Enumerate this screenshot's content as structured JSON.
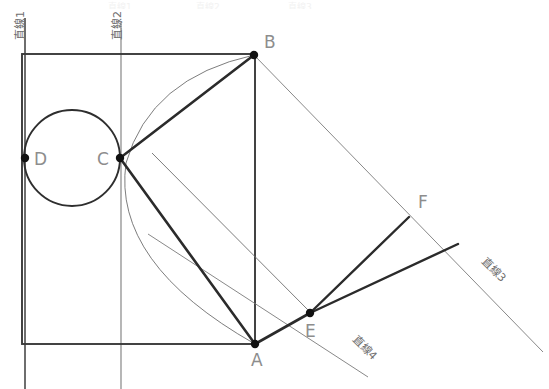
{
  "figure": {
    "background_color": "#ffffff",
    "stroke_dark": "#3a3a3a",
    "stroke_thin": "#6e6e6e",
    "label_color": "#8d8d8d"
  },
  "points": [
    {
      "id": "A",
      "label": "A",
      "x": 255,
      "y": 344,
      "label_x": 251,
      "label_y": 366
    },
    {
      "id": "B",
      "label": "B",
      "x": 254,
      "y": 55,
      "label_x": 264,
      "label_y": 48
    },
    {
      "id": "C",
      "label": "C",
      "x": 120,
      "y": 158,
      "label_x": 97,
      "label_y": 165
    },
    {
      "id": "D",
      "label": "D",
      "x": 25,
      "y": 158,
      "label_x": 34,
      "label_y": 165
    },
    {
      "id": "E",
      "label": "E",
      "x": 310,
      "y": 313,
      "label_x": 305,
      "label_y": 337
    },
    {
      "id": "F",
      "label": "F",
      "x": 411,
      "y": 215,
      "label_x": 418,
      "label_y": 208
    }
  ],
  "lines": [
    {
      "id": "line1",
      "label": "直線1",
      "label_x": 24,
      "label_y": 40,
      "rotation": -90
    },
    {
      "id": "line2",
      "label": "直線2",
      "label_x": 121,
      "label_y": 40,
      "rotation": -90
    },
    {
      "id": "line3",
      "label": "直線3",
      "label_x": 481,
      "label_y": 262,
      "rotation": 45
    },
    {
      "id": "line4",
      "label": "直線4",
      "label_x": 352,
      "label_y": 340,
      "rotation": 45
    }
  ],
  "circle": {
    "center_x": 72,
    "center_y": 158,
    "radius": 48
  },
  "rectangle": {
    "x": 22,
    "y": 54,
    "width": 233,
    "height": 290
  },
  "ghost_header": [
    {
      "text": "直線1",
      "x": 108
    },
    {
      "text": "直線2",
      "x": 196
    },
    {
      "text": "直線3",
      "x": 288
    }
  ]
}
